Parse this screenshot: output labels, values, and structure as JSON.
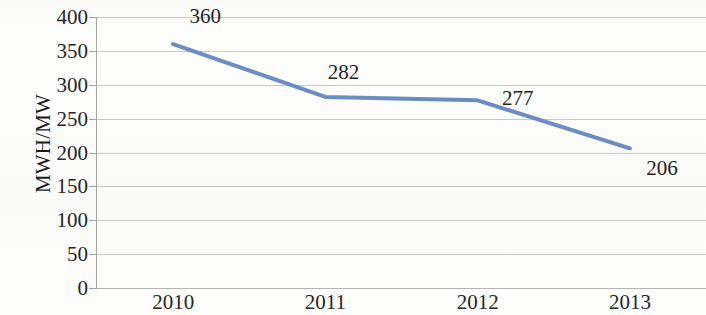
{
  "chart_data": {
    "type": "line",
    "title": "",
    "xlabel": "",
    "ylabel": "MWH/MW",
    "categories": [
      "2010",
      "2011",
      "2012",
      "2013"
    ],
    "values": [
      360,
      282,
      277,
      206
    ],
    "data_labels": [
      "360",
      "282",
      "277",
      "206"
    ],
    "ylim": [
      0,
      400
    ],
    "y_ticks": [
      "0",
      "50",
      "100",
      "150",
      "200",
      "250",
      "300",
      "350",
      "400"
    ],
    "grid": "horizontal",
    "legend": "none",
    "series": [
      {
        "name": "MWH/MW",
        "values": [
          360,
          282,
          277,
          206
        ],
        "color": "#6b8dc4"
      }
    ]
  },
  "colors": {
    "line": "#6b8dc4",
    "gridline": "#c9c9c9",
    "axis": "#a6a6a6",
    "text": "#1f1f1f",
    "background": "#fdfdfc"
  }
}
